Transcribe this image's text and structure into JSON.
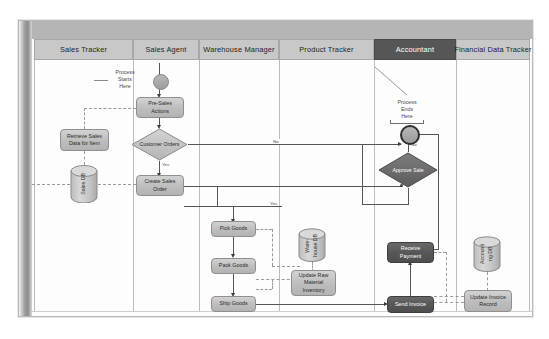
{
  "diagram": {
    "lanes": [
      {
        "id": "sales-tracker",
        "label": "Sales Tracker",
        "dark": false
      },
      {
        "id": "sales-agent",
        "label": "Sales Agent",
        "dark": false
      },
      {
        "id": "warehouse-manager",
        "label": "Warehouse Manager",
        "dark": false
      },
      {
        "id": "product-tracker",
        "label": "Product Tracker",
        "dark": false
      },
      {
        "id": "accountant",
        "label": "Accountant",
        "dark": true
      },
      {
        "id": "financial-data-tracker",
        "label": "Financial Data Tracker",
        "dark": false
      }
    ],
    "annotations": [
      {
        "id": "process-starts",
        "text": "Process\nStarts\nHere"
      },
      {
        "id": "process-ends",
        "text": "Process\nEnds\nHere"
      }
    ],
    "events": [
      {
        "id": "start-event",
        "type": "start",
        "lane": "sales-agent"
      },
      {
        "id": "end-event",
        "type": "end",
        "lane": "accountant"
      }
    ],
    "tasks": [
      {
        "id": "retrieve-sales-data",
        "label": "Retrieve Sales\nData for Item",
        "lane": "sales-tracker",
        "dark": false
      },
      {
        "id": "pre-sales-actions",
        "label": "Pre-Sales\nActions",
        "lane": "sales-agent",
        "dark": false
      },
      {
        "id": "create-sales-order",
        "label": "Create Sales\nOrder",
        "lane": "sales-agent",
        "dark": false
      },
      {
        "id": "pick-goods",
        "label": "Pick Goods",
        "lane": "warehouse-manager",
        "dark": false
      },
      {
        "id": "pack-goods",
        "label": "Pack Goods",
        "lane": "warehouse-manager",
        "dark": false
      },
      {
        "id": "ship-goods",
        "label": "Ship Goods",
        "lane": "warehouse-manager",
        "dark": false
      },
      {
        "id": "update-raw-material",
        "label": "Update Raw\nMaterial\nInventory",
        "lane": "product-tracker",
        "dark": false
      },
      {
        "id": "receive-payment",
        "label": "Receive\nPayment",
        "lane": "accountant",
        "dark": true
      },
      {
        "id": "send-invoice",
        "label": "Send  Invoice",
        "lane": "accountant",
        "dark": true
      },
      {
        "id": "update-invoice-record",
        "label": "Update Invoice\nRecord",
        "lane": "financial-data-tracker",
        "dark": false
      }
    ],
    "gateways": [
      {
        "id": "customer-orders",
        "label": "Customer\nOrders",
        "lane": "sales-agent",
        "dark": false
      },
      {
        "id": "approve-sale",
        "label": "Approve Sale",
        "lane": "accountant",
        "dark": true
      }
    ],
    "datastores": [
      {
        "id": "sales-db",
        "label": "Sales DB",
        "lane": "sales-tracker",
        "lines": 1
      },
      {
        "id": "warehouse-db",
        "label": "Ware-\nhouse DB",
        "lane": "product-tracker",
        "lines": 2
      },
      {
        "id": "accounting-db",
        "label": "Accounti\nng DB",
        "lane": "financial-data-tracker",
        "lines": 2
      }
    ],
    "flow_labels": [
      {
        "id": "yes-customer-orders",
        "text": "Yes"
      },
      {
        "id": "no-customer-orders",
        "text": "No"
      },
      {
        "id": "yes-approve-sale",
        "text": "Yes"
      },
      {
        "id": "no-approve-sale",
        "text": "No"
      }
    ]
  },
  "colors": {
    "lane_header": "#c8c8c8",
    "lane_header_dark": "#565656",
    "node_fill": "#c3c3c3",
    "node_fill_dark": "#565656",
    "connector": "#555555",
    "paper": "#ffffff"
  }
}
